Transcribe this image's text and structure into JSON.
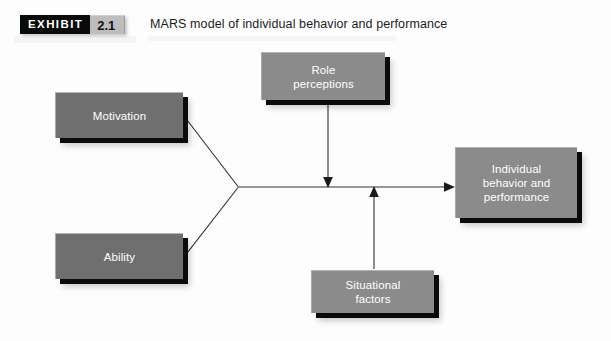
{
  "exhibit": {
    "word": "EXHIBIT",
    "number": "2.1",
    "title": "MARS model of individual behavior and performance"
  },
  "diagram": {
    "type": "flow-diagram",
    "nodes": [
      {
        "id": "motivation",
        "lines": [
          "Motivation"
        ],
        "shade": "dark"
      },
      {
        "id": "ability",
        "lines": [
          "Ability"
        ],
        "shade": "dark"
      },
      {
        "id": "role",
        "lines": [
          "Role",
          "perceptions"
        ],
        "shade": "mid"
      },
      {
        "id": "situational",
        "lines": [
          "Situational",
          "factors"
        ],
        "shade": "mid"
      },
      {
        "id": "outcome",
        "lines": [
          "Individual",
          "behavior and",
          "performance"
        ],
        "shade": "mid"
      }
    ],
    "edges": [
      {
        "from": "motivation",
        "to": "outcome",
        "style": "converging-line"
      },
      {
        "from": "ability",
        "to": "outcome",
        "style": "converging-line"
      },
      {
        "from": "role",
        "to": "main-path",
        "style": "arrow-down"
      },
      {
        "from": "situational",
        "to": "main-path",
        "style": "arrow-up"
      },
      {
        "from": "main-path",
        "to": "outcome",
        "style": "arrow-right"
      }
    ]
  },
  "colors": {
    "box_dark": "#6f6f6f",
    "box_mid": "#8b8b8b",
    "shadow": "#0b0b0b",
    "line": "#303030",
    "tag_black": "#0a0a0a",
    "tag_gray": "#bdbdbd",
    "page_background": "#fdfdfd"
  }
}
